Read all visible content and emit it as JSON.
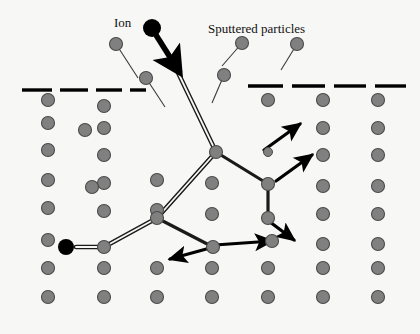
{
  "figure": {
    "background_color": "#f7f7f5",
    "width": 420,
    "height": 334
  },
  "labels": {
    "ion": "Ion",
    "sputtered_particles": "Sputtered particles"
  },
  "label_positions": {
    "ion": {
      "x": 114,
      "y": 27
    },
    "sputtered_particles": {
      "x": 208,
      "y": 33
    }
  },
  "colors": {
    "atom_fill": "#808080",
    "atom_stroke": "#4a4a4a",
    "ion_fill": "#000000",
    "track_line": "#1a1a1a",
    "arrow": "#000000",
    "surface_dash": "#000000",
    "text": "#111111"
  },
  "geometry": {
    "atom_radius": 6.5,
    "small_atom_radius": 4.5,
    "ion_radius": 9,
    "implanted_ion_radius": 8,
    "surface_y": 88
  },
  "surface_line": {
    "label": "surface-dashed-line",
    "left_segments": [
      {
        "x1": 22,
        "x2": 52,
        "y": 90
      },
      {
        "x1": 60,
        "x2": 88,
        "y": 90
      },
      {
        "x1": 96,
        "x2": 122,
        "y": 90
      },
      {
        "x1": 130,
        "x2": 146,
        "y": 90
      }
    ],
    "right_segments": [
      {
        "x1": 248,
        "x2": 283,
        "y": 86
      },
      {
        "x1": 292,
        "x2": 325,
        "y": 86
      },
      {
        "x1": 334,
        "x2": 366,
        "y": 86
      },
      {
        "x1": 375,
        "x2": 406,
        "y": 86
      }
    ]
  },
  "lattice_atoms": [
    {
      "x": 48,
      "y": 100
    },
    {
      "x": 48,
      "y": 123
    },
    {
      "x": 48,
      "y": 150
    },
    {
      "x": 48,
      "y": 180
    },
    {
      "x": 48,
      "y": 208
    },
    {
      "x": 48,
      "y": 240
    },
    {
      "x": 48,
      "y": 268
    },
    {
      "x": 48,
      "y": 297
    },
    {
      "x": 104,
      "y": 106
    },
    {
      "x": 104,
      "y": 128
    },
    {
      "x": 104,
      "y": 155
    },
    {
      "x": 104,
      "y": 183
    },
    {
      "x": 104,
      "y": 211
    },
    {
      "x": 104,
      "y": 247
    },
    {
      "x": 104,
      "y": 268
    },
    {
      "x": 104,
      "y": 297
    },
    {
      "x": 85,
      "y": 130
    },
    {
      "x": 92,
      "y": 187
    },
    {
      "x": 157,
      "y": 180
    },
    {
      "x": 157,
      "y": 210
    },
    {
      "x": 157,
      "y": 218
    },
    {
      "x": 157,
      "y": 268
    },
    {
      "x": 157,
      "y": 297
    },
    {
      "x": 212,
      "y": 183
    },
    {
      "x": 212,
      "y": 214
    },
    {
      "x": 213,
      "y": 247
    },
    {
      "x": 212,
      "y": 268
    },
    {
      "x": 212,
      "y": 297
    },
    {
      "x": 268,
      "y": 100
    },
    {
      "x": 268,
      "y": 268
    },
    {
      "x": 268,
      "y": 297
    },
    {
      "x": 272,
      "y": 241
    },
    {
      "x": 323,
      "y": 100
    },
    {
      "x": 323,
      "y": 128
    },
    {
      "x": 323,
      "y": 155
    },
    {
      "x": 323,
      "y": 186
    },
    {
      "x": 323,
      "y": 214
    },
    {
      "x": 323,
      "y": 244
    },
    {
      "x": 323,
      "y": 268
    },
    {
      "x": 323,
      "y": 297
    },
    {
      "x": 378,
      "y": 100
    },
    {
      "x": 378,
      "y": 128
    },
    {
      "x": 378,
      "y": 155
    },
    {
      "x": 378,
      "y": 186
    },
    {
      "x": 378,
      "y": 214
    },
    {
      "x": 378,
      "y": 244
    },
    {
      "x": 378,
      "y": 268
    },
    {
      "x": 378,
      "y": 297
    },
    {
      "x": 216,
      "y": 152
    },
    {
      "x": 268,
      "y": 184
    },
    {
      "x": 268,
      "y": 218
    }
  ],
  "small_atoms": [
    {
      "x": 268,
      "y": 152
    }
  ],
  "sputtered_particles": [
    {
      "x": 116,
      "y": 44,
      "trail_x": 138,
      "trail_y": 78
    },
    {
      "x": 146,
      "y": 78,
      "trail_x": 165,
      "trail_y": 107
    },
    {
      "x": 242,
      "y": 43,
      "trail_x": 222,
      "trail_y": 66
    },
    {
      "x": 297,
      "y": 44,
      "trail_x": 281,
      "trail_y": 70
    },
    {
      "x": 224,
      "y": 75,
      "trail_x": 212,
      "trail_y": 103
    }
  ],
  "incident_ion": {
    "x": 152,
    "y": 28,
    "arrow_tip_x": 180,
    "arrow_tip_y": 73
  },
  "implanted_ion": {
    "x": 66,
    "y": 247
  },
  "ion_track": {
    "description": "double-line ion trajectory",
    "points": [
      {
        "x": 172,
        "y": 60
      },
      {
        "x": 216,
        "y": 152
      },
      {
        "x": 157,
        "y": 218
      },
      {
        "x": 104,
        "y": 247
      },
      {
        "x": 76,
        "y": 247
      }
    ]
  },
  "cascade_paths": [
    {
      "name": "node-to-right-node",
      "points": [
        {
          "x": 216,
          "y": 152
        },
        {
          "x": 268,
          "y": 184
        }
      ]
    },
    {
      "name": "right-node-down",
      "points": [
        {
          "x": 268,
          "y": 184
        },
        {
          "x": 268,
          "y": 218
        }
      ]
    },
    {
      "name": "node-to-lower-left",
      "points": [
        {
          "x": 216,
          "y": 152
        },
        {
          "x": 157,
          "y": 218
        }
      ]
    },
    {
      "name": "lower-left-to-v-node",
      "points": [
        {
          "x": 157,
          "y": 218
        },
        {
          "x": 213,
          "y": 247
        }
      ]
    }
  ],
  "cascade_arrows": [
    {
      "name": "small-atom-escape-arrow",
      "x1": 264,
      "y1": 150,
      "x2": 300,
      "y2": 124
    },
    {
      "name": "right-node-escape-arrow",
      "x1": 276,
      "y1": 181,
      "x2": 312,
      "y2": 155
    },
    {
      "name": "lower-right-recoil-arrow",
      "x1": 270,
      "y1": 222,
      "x2": 294,
      "y2": 240
    },
    {
      "name": "recoil-arrow-right",
      "x1": 215,
      "y1": 245,
      "x2": 272,
      "y2": 241
    },
    {
      "name": "recoil-arrow-left",
      "x1": 210,
      "y1": 248,
      "x2": 170,
      "y2": 259
    }
  ]
}
